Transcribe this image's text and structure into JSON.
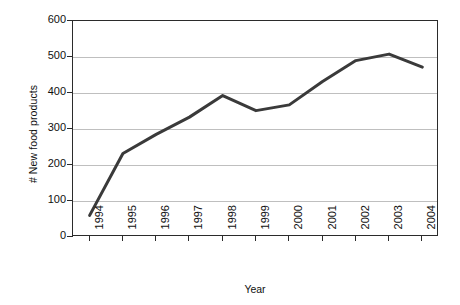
{
  "chart_data": {
    "type": "line",
    "title": "",
    "xlabel": "Year",
    "ylabel": "# New food products",
    "categories": [
      "1994",
      "1995",
      "1996",
      "1997",
      "1998",
      "1999",
      "2000",
      "2001",
      "2002",
      "2003",
      "2004"
    ],
    "values": [
      60,
      232,
      285,
      333,
      393,
      351,
      367,
      432,
      490,
      508,
      472
    ],
    "series": [
      {
        "name": "# New food products",
        "values": [
          60,
          232,
          285,
          333,
          393,
          351,
          367,
          432,
          490,
          508,
          472
        ]
      }
    ],
    "ylim": [
      0,
      600
    ],
    "y_ticks": [
      0,
      100,
      200,
      300,
      400,
      500,
      600
    ],
    "y_tick_labels": [
      "0",
      "100",
      "200",
      "300",
      "400",
      "500",
      "600"
    ],
    "grid": "horizontal",
    "legend": "none",
    "line_color": "#3a3a3a",
    "line_width": 3,
    "markers": "none",
    "background_color": "#ffffff",
    "gridline_color": "#bfbfbf",
    "axis_color": "#2b2b2b",
    "x_tick_label_rotation": -90
  }
}
